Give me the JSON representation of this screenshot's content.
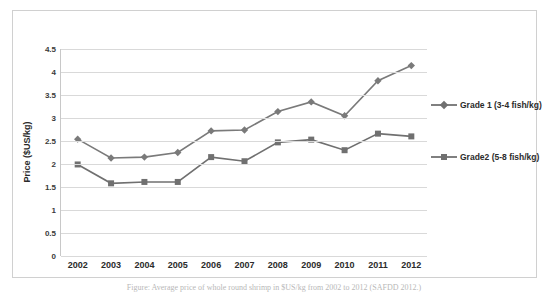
{
  "chart_data": {
    "type": "line",
    "title": "",
    "xlabel": "",
    "ylabel": "Price ($US/kg)",
    "categories": [
      "2002",
      "2003",
      "2004",
      "2005",
      "2006",
      "2007",
      "2008",
      "2009",
      "2010",
      "2011",
      "2012"
    ],
    "ylim": [
      0,
      4.5
    ],
    "ytick_labels": [
      "0",
      "0.5",
      "1",
      "1.5",
      "2",
      "2.5",
      "3",
      "3.5",
      "4",
      "4.5"
    ],
    "ytick_values": [
      0,
      0.5,
      1,
      1.5,
      2,
      2.5,
      3,
      3.5,
      4,
      4.5
    ],
    "grid": true,
    "legend_position": "right",
    "series": [
      {
        "name": "Grade 1 (3-4 fish/kg)",
        "marker": "diamond",
        "color": "#7a7a7a",
        "values": [
          2.54,
          2.13,
          2.15,
          2.25,
          2.72,
          2.74,
          3.14,
          3.35,
          3.05,
          3.81,
          4.14
        ]
      },
      {
        "name": "Grade2 (5-8 fish/kg)",
        "marker": "square",
        "color": "#707070",
        "values": [
          1.99,
          1.58,
          1.61,
          1.61,
          2.15,
          2.06,
          2.47,
          2.53,
          2.3,
          2.66,
          2.6
        ]
      }
    ]
  },
  "legend": {
    "entries": [
      {
        "label": "Grade 1 (3-4 fish/kg)"
      },
      {
        "label": "Grade2 (5-8 fish/kg)"
      }
    ]
  },
  "caption": "Figure: Average price of whole round shrimp in $US/kg from 2002 to 2012 (SAFDD 2012.)"
}
